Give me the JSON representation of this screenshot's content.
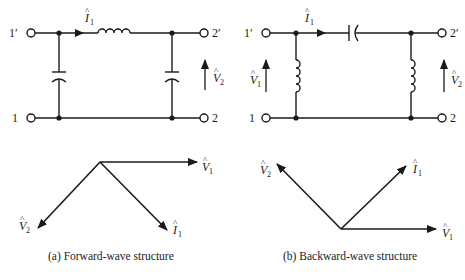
{
  "figure": {
    "panels": [
      {
        "id": "a",
        "caption": "(a)  Forward-wave structure",
        "circuit": {
          "terminals": {
            "top_left": "1′",
            "bottom_left": "1",
            "top_right": "2′",
            "bottom_right": "2"
          },
          "series_element": "inductor",
          "shunt_elements": [
            "capacitor",
            "capacitor"
          ],
          "current_label": "I",
          "current_sub": "1",
          "voltage_labels": [
            {
              "sym": "V",
              "sub": "2"
            }
          ]
        },
        "phasors": [
          {
            "sym": "V",
            "sub": "1",
            "direction": "right"
          },
          {
            "sym": "V",
            "sub": "2",
            "direction": "down-left"
          },
          {
            "sym": "I",
            "sub": "1",
            "direction": "down-right"
          }
        ]
      },
      {
        "id": "b",
        "caption": "(b)  Backward-wave structure",
        "circuit": {
          "terminals": {
            "top_left": "1′",
            "bottom_left": "1",
            "top_right": "2′",
            "bottom_right": "2"
          },
          "series_element": "capacitor",
          "shunt_elements": [
            "inductor",
            "inductor"
          ],
          "current_label": "I",
          "current_sub": "1",
          "voltage_labels": [
            {
              "sym": "V",
              "sub": "1"
            },
            {
              "sym": "V",
              "sub": "2"
            }
          ]
        },
        "phasors": [
          {
            "sym": "V",
            "sub": "1",
            "direction": "right"
          },
          {
            "sym": "V",
            "sub": "2",
            "direction": "up-left"
          },
          {
            "sym": "I",
            "sub": "1",
            "direction": "up-right"
          }
        ]
      }
    ],
    "labels": {
      "t1p": "1′",
      "t1": "1",
      "t2p": "2′",
      "t2": "2",
      "I": "I",
      "V": "V",
      "one": "1",
      "two": "2",
      "hat": "^"
    }
  }
}
